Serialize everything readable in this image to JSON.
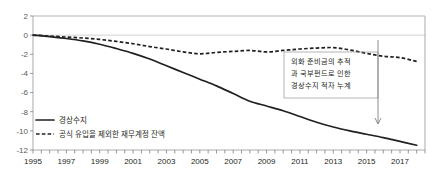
{
  "chart_data": {
    "type": "line",
    "title": "",
    "subtitle": "",
    "xlabel": "",
    "ylabel": "",
    "xlim": [
      1995,
      2018.5
    ],
    "ylim": [
      -12,
      2
    ],
    "yticks": [
      "2",
      "0",
      "-2",
      "-4",
      "-6",
      "-8",
      "-10",
      "-12"
    ],
    "ytick_values": [
      2,
      0,
      -2,
      -4,
      -6,
      -8,
      -10,
      -12
    ],
    "xticks": [
      "1995",
      "1997",
      "1999",
      "2001",
      "2003",
      "2005",
      "2007",
      "2009",
      "2011",
      "2013",
      "2015",
      "2017"
    ],
    "xtick_values": [
      1995,
      1997,
      1999,
      2001,
      2003,
      2005,
      2007,
      2009,
      2011,
      2013,
      2015,
      2017
    ],
    "grid": "horizontal-at-2-and-0",
    "legend_position": "inside-bottom-left",
    "x": [
      1995,
      1996,
      1997,
      1998,
      1999,
      2000,
      2001,
      2002,
      2003,
      2004,
      2005,
      2006,
      2007,
      2008,
      2009,
      2010,
      2011,
      2012,
      2013,
      2014,
      2015,
      2016,
      2017,
      2018
    ],
    "series": [
      {
        "name": "경상수지",
        "style": "solid",
        "color": "#231f20",
        "values": [
          0.0,
          -0.15,
          -0.35,
          -0.6,
          -0.95,
          -1.4,
          -1.9,
          -2.5,
          -3.2,
          -3.9,
          -4.6,
          -5.3,
          -6.1,
          -6.9,
          -7.4,
          -7.9,
          -8.5,
          -9.1,
          -9.6,
          -10.0,
          -10.35,
          -10.7,
          -11.1,
          -11.5
        ]
      },
      {
        "name": "공식 유입을 제외한 재무계정 잔액",
        "style": "dashed",
        "color": "#231f20",
        "values": [
          0.0,
          -0.1,
          -0.2,
          -0.3,
          -0.45,
          -0.65,
          -0.9,
          -1.2,
          -1.45,
          -1.75,
          -1.95,
          -1.8,
          -1.7,
          -1.6,
          -1.75,
          -1.6,
          -1.45,
          -1.35,
          -1.3,
          -1.55,
          -1.9,
          -2.2,
          -2.35,
          -2.75
        ]
      }
    ],
    "annotations": [
      {
        "name": "reserves-sovereign-fund-note",
        "lines": [
          "외화 준비금의 추적",
          "과 국부펀드로 인한",
          "경상수지 적자 누계"
        ],
        "text": "외화 준비금의 추적과 국부펀드로 인한 경상수지 적자 누계",
        "pointer_x_value": 2016,
        "pointer_from_value": -2.4,
        "pointer_to_value": -9.3
      }
    ]
  },
  "legend": {
    "items": [
      {
        "label": "경상수지",
        "style": "solid"
      },
      {
        "label": "공식 유입을 제외한 재무계정 잔액",
        "style": "dashed"
      }
    ]
  }
}
